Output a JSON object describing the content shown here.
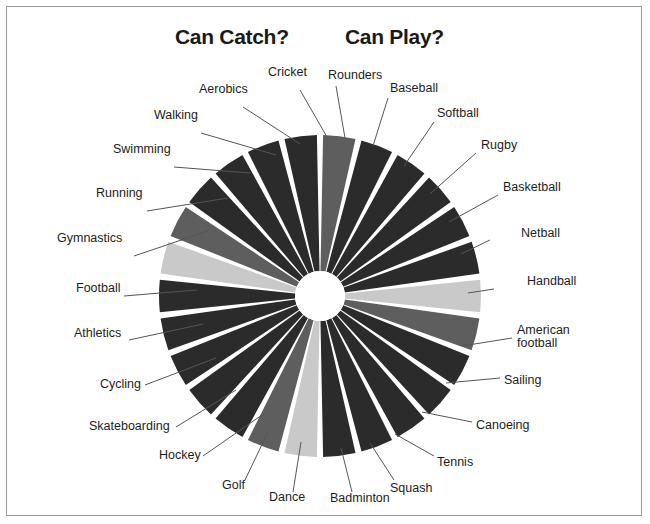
{
  "figure": {
    "headings": [
      {
        "id": "can-catch",
        "text": "Can Catch?"
      },
      {
        "id": "can-play",
        "text": "Can Play?"
      }
    ],
    "border_color": "#9a9a9a",
    "background": "#ffffff"
  },
  "palette": {
    "dark": "#2b2b2b",
    "medium": "#5e5e5e",
    "light": "#c9c9c9",
    "gap": "#ffffff",
    "hole": "#ffffff",
    "leader_line": "#555555",
    "label_text": "#1d1d1d"
  },
  "chart_data": {
    "type": "pie",
    "title": "",
    "subtitle": "",
    "variant": "donut",
    "center": {
      "x": 320,
      "y": 296
    },
    "outer_radius": 161,
    "inner_radius": 25,
    "start_angle_deg": -90,
    "direction": "clockwise",
    "slice_gap_deg": 2.2,
    "legend": "radial-labels",
    "grid": false,
    "groups": [
      {
        "name": "Can Catch?",
        "note": "left half of wheel"
      },
      {
        "name": "Can Play?",
        "note": "right half of wheel"
      }
    ],
    "categories": [
      "Rounders",
      "Baseball",
      "Softball",
      "Rugby",
      "Basketball",
      "Netball",
      "Handball",
      "American football",
      "Sailing",
      "Canoeing",
      "Tennis",
      "Squash",
      "Badminton",
      "Dance",
      "Golf",
      "Hockey",
      "Skateboarding",
      "Cycling",
      "Athletics",
      "Football",
      "Gymnastics",
      "Running",
      "Swimming",
      "Walking",
      "Aerobics",
      "Cricket"
    ],
    "values": [
      3.85,
      3.85,
      3.85,
      3.85,
      3.85,
      3.85,
      3.85,
      3.85,
      3.85,
      3.85,
      3.85,
      3.85,
      3.85,
      3.85,
      3.85,
      3.85,
      3.85,
      3.85,
      3.85,
      3.85,
      3.85,
      3.85,
      3.85,
      3.85,
      3.85,
      3.85
    ],
    "shades": [
      "medium",
      "dark",
      "dark",
      "dark",
      "dark",
      "dark",
      "light",
      "medium",
      "dark",
      "dark",
      "dark",
      "dark",
      "dark",
      "light",
      "medium",
      "dark",
      "dark",
      "dark",
      "dark",
      "dark",
      "light",
      "medium",
      "dark",
      "dark",
      "dark",
      "dark"
    ],
    "xlabel": "",
    "ylabel": ""
  },
  "labels": [
    {
      "text": "Cricket",
      "side": "l",
      "x": 268,
      "y": 73,
      "ax": 300,
      "ay": 90,
      "tx": 327,
      "ty": 137
    },
    {
      "text": "Aerobics",
      "side": "l",
      "x": 199,
      "y": 90,
      "ax": 243,
      "ay": 107,
      "tx": 300,
      "ty": 144
    },
    {
      "text": "Walking",
      "side": "l",
      "x": 154,
      "y": 116,
      "ax": 201,
      "ay": 133,
      "tx": 276,
      "ty": 155
    },
    {
      "text": "Swimming",
      "side": "l",
      "x": 113,
      "y": 150,
      "ax": 174,
      "ay": 167,
      "tx": 250,
      "ty": 173
    },
    {
      "text": "Running",
      "side": "l",
      "x": 96,
      "y": 194,
      "ax": 147,
      "ay": 211,
      "tx": 228,
      "ty": 198
    },
    {
      "text": "Gymnastics",
      "side": "l",
      "x": 57,
      "y": 239,
      "ax": 134,
      "ay": 256,
      "tx": 208,
      "ty": 231
    },
    {
      "text": "Football",
      "side": "l",
      "x": 76,
      "y": 289,
      "ax": 124,
      "ay": 296,
      "tx": 197,
      "ty": 290
    },
    {
      "text": "Athletics",
      "side": "l",
      "x": 74,
      "y": 334,
      "ax": 129,
      "ay": 340,
      "tx": 203,
      "ty": 324
    },
    {
      "text": "Cycling",
      "side": "l",
      "x": 100,
      "y": 385,
      "ax": 145,
      "ay": 385,
      "tx": 216,
      "ty": 358
    },
    {
      "text": "Skateboarding",
      "side": "l",
      "x": 89,
      "y": 427,
      "ax": 176,
      "ay": 427,
      "tx": 236,
      "ty": 390
    },
    {
      "text": "Hockey",
      "side": "l",
      "x": 159,
      "y": 456,
      "ax": 203,
      "ay": 456,
      "tx": 262,
      "ty": 415
    },
    {
      "text": "Golf",
      "side": "l",
      "x": 222,
      "y": 486,
      "ax": 245,
      "ay": 480,
      "tx": 268,
      "ty": 432
    },
    {
      "text": "Dance",
      "side": "l",
      "x": 269,
      "y": 498,
      "ax": 293,
      "ay": 492,
      "tx": 301,
      "ty": 442
    },
    {
      "text": "Badminton",
      "side": "l",
      "x": 330,
      "y": 499,
      "ax": 352,
      "ay": 492,
      "tx": 341,
      "ty": 448
    },
    {
      "text": "Squash",
      "side": "r",
      "x": 390,
      "y": 489,
      "ax": 394,
      "ay": 480,
      "tx": 370,
      "ty": 443
    },
    {
      "text": "Tennis",
      "side": "r",
      "x": 437,
      "y": 463,
      "ax": 434,
      "ay": 456,
      "tx": 395,
      "ty": 434
    },
    {
      "text": "Canoeing",
      "side": "r",
      "x": 476,
      "y": 426,
      "ax": 472,
      "ay": 422,
      "tx": 422,
      "ty": 412
    },
    {
      "text": "Sailing",
      "side": "r",
      "x": 504,
      "y": 381,
      "ax": 500,
      "ay": 378,
      "tx": 446,
      "ty": 383
    },
    {
      "text": "American",
      "side": "r",
      "x": 517,
      "y": 331,
      "ax": 512,
      "ay": 338,
      "tx": 462,
      "ty": 346,
      "text2": "football"
    },
    {
      "text": "Handball",
      "side": "r",
      "x": 527,
      "y": 282,
      "ax": 494,
      "ay": 289,
      "tx": 468,
      "ty": 293
    },
    {
      "text": "Netball",
      "side": "r",
      "x": 521,
      "y": 234,
      "ax": 490,
      "ay": 240,
      "tx": 461,
      "ty": 254
    },
    {
      "text": "Basketball",
      "side": "r",
      "x": 503,
      "y": 188,
      "ax": 498,
      "ay": 195,
      "tx": 449,
      "ty": 222
    },
    {
      "text": "Rugby",
      "side": "r",
      "x": 481,
      "y": 146,
      "ax": 476,
      "ay": 153,
      "tx": 430,
      "ty": 194
    },
    {
      "text": "Softball",
      "side": "r",
      "x": 437,
      "y": 114,
      "ax": 434,
      "ay": 122,
      "tx": 404,
      "ty": 166
    },
    {
      "text": "Baseball",
      "side": "r",
      "x": 390,
      "y": 89,
      "ax": 388,
      "ay": 98,
      "tx": 373,
      "ty": 146
    },
    {
      "text": "Rounders",
      "side": "r",
      "x": 328,
      "y": 76,
      "ax": 336,
      "ay": 86,
      "tx": 345,
      "ty": 138
    }
  ]
}
